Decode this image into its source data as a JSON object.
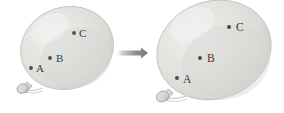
{
  "figure": {
    "background_color": "#ffffff",
    "width": 284,
    "height": 113
  },
  "palette": {
    "balloon_fill_light": "#e9e9e7",
    "balloon_fill_mid": "#dcdcda",
    "balloon_fill_edge": "#cfcfcc",
    "balloon_outline": "#c2c2bf",
    "point_color": "#4a4a4a",
    "label_color": "#3b3b3b",
    "arrow_color": "#8a8a8a",
    "knot_fill": "#d5d5d2",
    "knot_outline": "#9e9e9b"
  },
  "balloons": [
    {
      "id": "left-balloon",
      "name": "small-balloon",
      "cx": 67,
      "cy": 48,
      "rx": 47,
      "ry": 41,
      "rotation": -18,
      "knot": {
        "cx": 23,
        "cy": 87,
        "rx": 6,
        "ry": 5,
        "rotation": -30
      },
      "points": [
        {
          "label": "A",
          "dot_x": 31,
          "dot_y": 68,
          "text_x": 36,
          "text_y": 72
        },
        {
          "label": "B",
          "dot_x": 50,
          "dot_y": 58,
          "text_x": 56,
          "text_y": 62
        },
        {
          "label": "C",
          "dot_x": 74,
          "dot_y": 33,
          "text_x": 79,
          "text_y": 37
        }
      ]
    },
    {
      "id": "right-balloon",
      "name": "large-balloon",
      "cx": 214,
      "cy": 50,
      "rx": 58,
      "ry": 49,
      "rotation": -18,
      "knot": {
        "cx": 163,
        "cy": 95,
        "rx": 7,
        "ry": 6,
        "rotation": -30
      },
      "points": [
        {
          "label": "A",
          "dot_x": 177,
          "dot_y": 78,
          "text_x": 183,
          "text_y": 83
        },
        {
          "label": "B",
          "dot_x": 200,
          "dot_y": 58,
          "text_x": 207,
          "text_y": 62
        },
        {
          "label": "C",
          "dot_x": 229,
          "dot_y": 27,
          "text_x": 236,
          "text_y": 31
        }
      ]
    }
  ],
  "arrow": {
    "name": "transition-arrow",
    "x_start": 116,
    "x_end": 148,
    "y": 53,
    "color": "#8a8a8a"
  },
  "caption": {
    "alt_text": "A small balloon with marked points A, B and C expands into a larger balloon with the same points spread further apart."
  }
}
